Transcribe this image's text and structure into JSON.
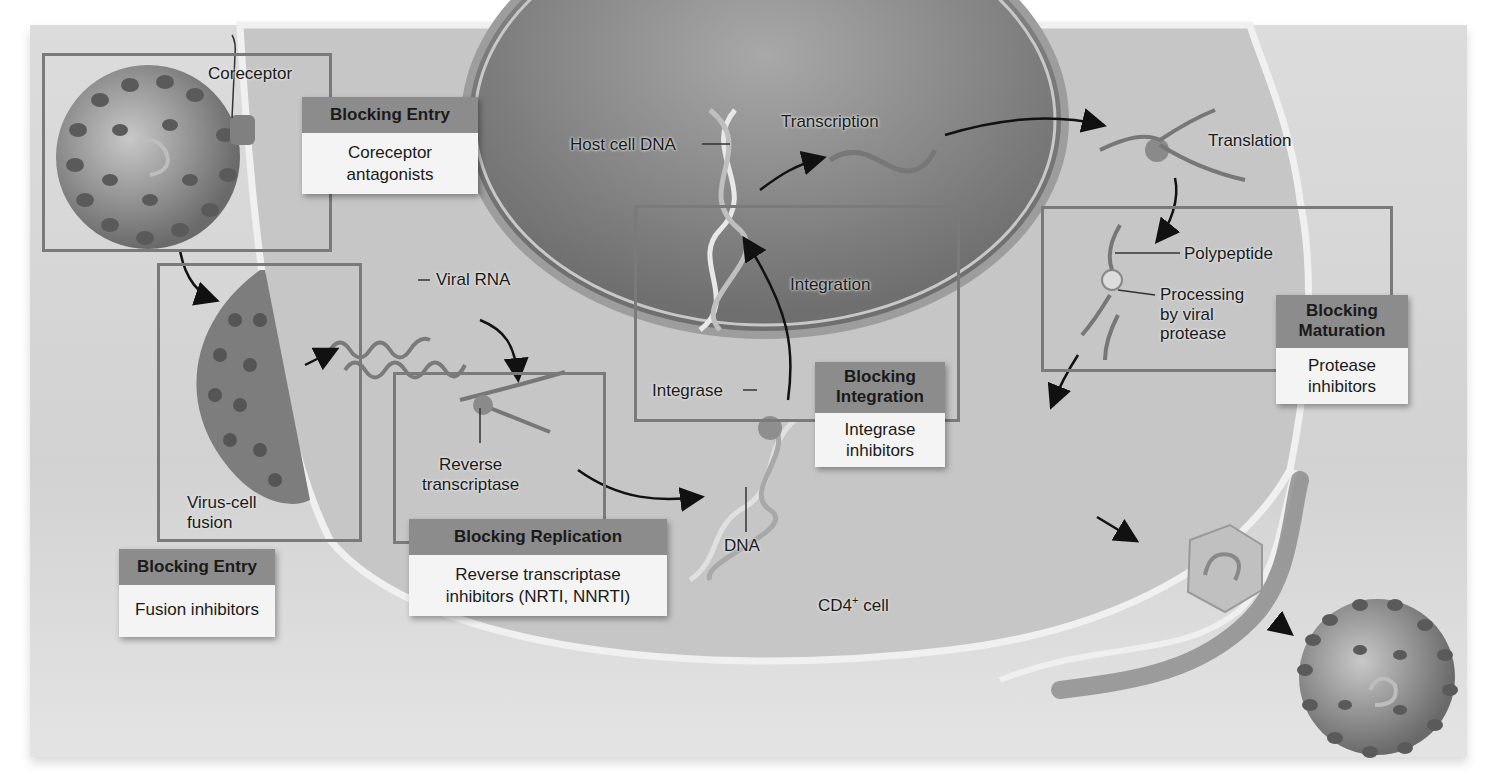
{
  "figure": {
    "cell_label": "CD4",
    "cell_label_sup": "+",
    "cell_label_suffix": " cell"
  },
  "labels": {
    "coreceptor": "Coreceptor",
    "viral_rna": "Viral RNA",
    "virus_cell_fusion_1": "Virus-cell",
    "virus_cell_fusion_2": "fusion",
    "reverse_transcriptase_1": "Reverse",
    "reverse_transcriptase_2": "transcriptase",
    "dna": "DNA",
    "integrase": "Integrase",
    "integration": "Integration",
    "host_cell_dna": "Host cell DNA",
    "transcription": "Transcription",
    "translation": "Translation",
    "polypeptide": "Polypeptide",
    "processing_1": "Processing",
    "processing_2": "by viral",
    "processing_3": "protease"
  },
  "blocking_boxes": [
    {
      "title": "Blocking Entry",
      "body_1": "Coreceptor",
      "body_2": "antagonists"
    },
    {
      "title": "Blocking Entry",
      "body_1": "Fusion inhibitors",
      "body_2": ""
    },
    {
      "title": "Blocking Replication",
      "body_1": "Reverse transcriptase",
      "body_2": "inhibitors (NRTI, NNRTI)"
    },
    {
      "title_1": "Blocking",
      "title_2": "Integration",
      "body_1": "Integrase",
      "body_2": "inhibitors"
    },
    {
      "title_1": "Blocking",
      "title_2": "Maturation",
      "body_1": "Protease",
      "body_2": "inhibitors"
    }
  ],
  "colors": {
    "background": "#d6d6d6",
    "box_header": "#8c8c8c",
    "box_body": "#f4f4f4",
    "frame": "#7a7a7a",
    "nucleus": "#8a8a8a",
    "virus": "#6e6e6e"
  }
}
